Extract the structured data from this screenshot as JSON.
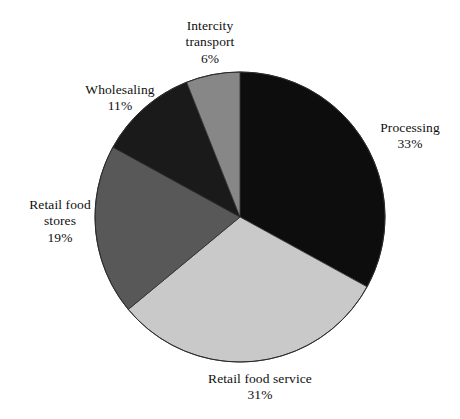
{
  "chart_data": {
    "type": "pie",
    "title": "",
    "subtitle": "",
    "xlabel": "",
    "ylabel": "",
    "legend_position": "none",
    "grid": false,
    "units": "percent",
    "start_angle_deg": 0,
    "direction": "clockwise",
    "categories": [
      "Processing",
      "Retail food service",
      "Retail food stores",
      "Wholesaling",
      "Intercity transport"
    ],
    "values": [
      33,
      31,
      19,
      11,
      6
    ],
    "value_labels": [
      "33%",
      "31%",
      "19%",
      "11%",
      "6%"
    ],
    "colors": [
      "#0d0d0d",
      "#c9c9c9",
      "#585858",
      "#1a1a1a",
      "#878787"
    ],
    "slices": [
      {
        "label": "Processing",
        "value": 33,
        "value_label": "33%",
        "color": "#0d0d0d",
        "start_deg": 0,
        "end_deg": 118.8
      },
      {
        "label": "Retail food service",
        "value": 31,
        "value_label": "31%",
        "color": "#c9c9c9",
        "start_deg": 118.8,
        "end_deg": 230.4
      },
      {
        "label": "Retail food stores",
        "value": 19,
        "value_label": "19%",
        "color": "#585858",
        "start_deg": 230.4,
        "end_deg": 298.8
      },
      {
        "label": "Wholesaling",
        "value": 11,
        "value_label": "11%",
        "color": "#1a1a1a",
        "start_deg": 298.8,
        "end_deg": 338.4
      },
      {
        "label": "Intercity transport",
        "value": 6,
        "value_label": "6%",
        "color": "#878787",
        "start_deg": 338.4,
        "end_deg": 360
      }
    ]
  },
  "labels": {
    "intercity_transport": {
      "name_line1": "Intercity",
      "name_line2": "transport",
      "pct": "6%"
    },
    "wholesaling": {
      "name_line1": "Wholesaling",
      "pct": "11%"
    },
    "retail_food_stores": {
      "name_line1": "Retail food",
      "name_line2": "stores",
      "pct": "19%"
    },
    "processing": {
      "name_line1": "Processing",
      "pct": "33%"
    },
    "retail_food_service": {
      "name_line1": "Retail food service",
      "pct": "31%"
    }
  },
  "geometry": {
    "center_x": 240,
    "center_y": 217,
    "radius": 145
  },
  "style": {
    "background": "#ffffff",
    "outline": "#2b2b2b",
    "text_color": "#0f0f0f"
  }
}
